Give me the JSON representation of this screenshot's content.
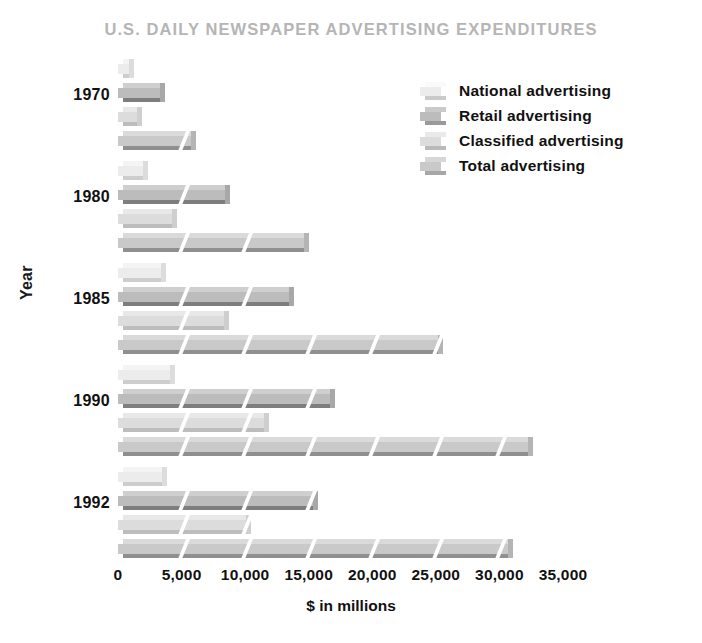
{
  "chart_data": {
    "type": "bar",
    "title": "U.S. DAILY NEWSPAPER ADVERTISING EXPENDITURES",
    "subtitle": "",
    "orientation": "horizontal",
    "xlabel": "$ in millions",
    "ylabel": "Year",
    "categories": [
      "1970",
      "1980",
      "1985",
      "1990",
      "1992"
    ],
    "series": [
      {
        "name": "National advertising",
        "values": [
          891,
          1963,
          3352,
          4122,
          3478
        ]
      },
      {
        "name": "Retail advertising",
        "values": [
          3292,
          8442,
          13443,
          16652,
          15320
        ]
      },
      {
        "name": "Classified advertising",
        "values": [
          1521,
          4222,
          8375,
          11506,
          10087
        ]
      },
      {
        "name": "Total advertising",
        "values": [
          5704,
          14627,
          25170,
          32281,
          30639
        ]
      }
    ],
    "xlim": [
      0,
      35000
    ],
    "xticks": [
      0,
      5000,
      10000,
      15000,
      20000,
      25000,
      30000,
      35000
    ],
    "xtick_labels": [
      "0",
      "5,000",
      "10,000",
      "15,000",
      "20,000",
      "25,000",
      "30,000",
      "35,000"
    ],
    "grid": false,
    "legend_position": "upper right",
    "colors": {
      "national": "#ececec",
      "retail": "#bcbcbc",
      "classified": "#dcdcdc",
      "total": "#c9c9c9",
      "title": "#b5b5b5",
      "text": "#111111",
      "background": "#ffffff"
    },
    "segment_interval": 5000
  },
  "legend": {
    "items": [
      {
        "label": "National advertising",
        "key": "national"
      },
      {
        "label": "Retail advertising",
        "key": "retail"
      },
      {
        "label": "Classified advertising",
        "key": "classified"
      },
      {
        "label": "Total advertising",
        "key": "total"
      }
    ]
  }
}
